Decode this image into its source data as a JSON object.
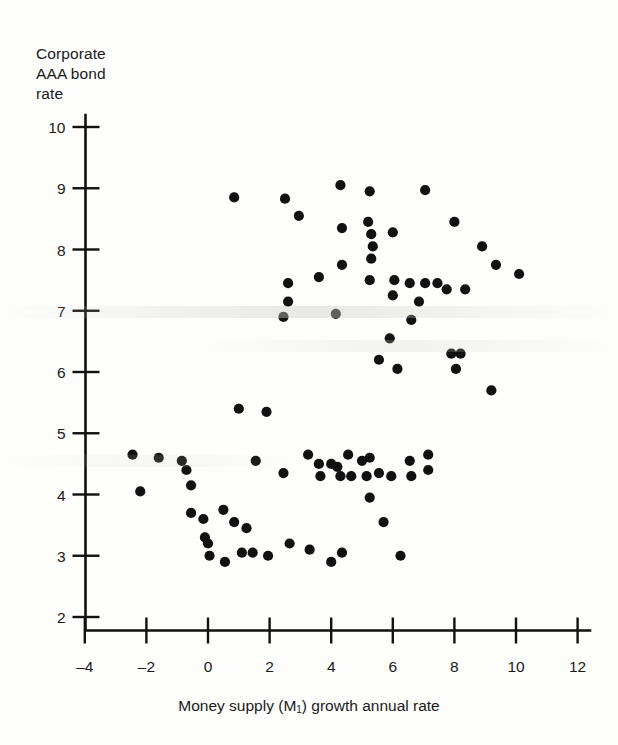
{
  "chart_data": {
    "type": "scatter",
    "title": "",
    "xlabel": "Money supply (M₁) growth annual rate",
    "ylabel": "Corporate AAA bond rate",
    "ylabel_lines": [
      "Corporate",
      "AAA bond",
      "rate"
    ],
    "xlim": [
      -4,
      12
    ],
    "ylim": [
      2,
      10
    ],
    "xticks": [
      -4,
      -2,
      0,
      2,
      4,
      6,
      8,
      10,
      12
    ],
    "xticklabels": [
      "-4",
      "-2",
      "0",
      "2",
      "4",
      "6",
      "8",
      "10",
      "12"
    ],
    "yticks": [
      2,
      3,
      4,
      5,
      6,
      7,
      8,
      9,
      10
    ],
    "yticklabels": [
      "2",
      "3",
      "4",
      "5",
      "6",
      "7",
      "8",
      "9",
      "10"
    ],
    "grid": false,
    "legend": null,
    "marker": "filled-circle",
    "marker_color": "#111111",
    "marker_size": 9,
    "points": [
      [
        0.85,
        8.85
      ],
      [
        2.5,
        8.83
      ],
      [
        2.95,
        8.55
      ],
      [
        4.3,
        9.05
      ],
      [
        5.25,
        8.95
      ],
      [
        7.05,
        8.97
      ],
      [
        4.35,
        8.35
      ],
      [
        5.2,
        8.45
      ],
      [
        5.3,
        8.25
      ],
      [
        5.35,
        8.05
      ],
      [
        6.0,
        8.28
      ],
      [
        8.0,
        8.45
      ],
      [
        8.9,
        8.05
      ],
      [
        5.3,
        7.85
      ],
      [
        4.35,
        7.75
      ],
      [
        3.6,
        7.55
      ],
      [
        5.25,
        7.5
      ],
      [
        6.05,
        7.5
      ],
      [
        6.55,
        7.45
      ],
      [
        7.05,
        7.45
      ],
      [
        7.45,
        7.45
      ],
      [
        7.75,
        7.35
      ],
      [
        8.35,
        7.35
      ],
      [
        10.1,
        7.6
      ],
      [
        9.35,
        7.75
      ],
      [
        2.6,
        7.45
      ],
      [
        2.6,
        7.15
      ],
      [
        2.45,
        6.9
      ],
      [
        4.15,
        6.95
      ],
      [
        6.0,
        7.25
      ],
      [
        6.85,
        7.15
      ],
      [
        6.6,
        6.85
      ],
      [
        5.9,
        6.55
      ],
      [
        5.55,
        6.2
      ],
      [
        6.15,
        6.05
      ],
      [
        7.9,
        6.3
      ],
      [
        8.2,
        6.3
      ],
      [
        8.05,
        6.05
      ],
      [
        9.2,
        5.7
      ],
      [
        1.0,
        5.4
      ],
      [
        1.9,
        5.35
      ],
      [
        -2.45,
        4.65
      ],
      [
        -1.6,
        4.6
      ],
      [
        -0.85,
        4.55
      ],
      [
        -0.7,
        4.4
      ],
      [
        1.55,
        4.55
      ],
      [
        2.45,
        4.35
      ],
      [
        3.25,
        4.65
      ],
      [
        3.6,
        4.5
      ],
      [
        3.65,
        4.3
      ],
      [
        4.0,
        4.5
      ],
      [
        4.2,
        4.45
      ],
      [
        4.3,
        4.3
      ],
      [
        4.55,
        4.65
      ],
      [
        4.65,
        4.3
      ],
      [
        5.0,
        4.55
      ],
      [
        5.15,
        4.3
      ],
      [
        5.25,
        4.6
      ],
      [
        5.55,
        4.35
      ],
      [
        5.95,
        4.3
      ],
      [
        6.55,
        4.55
      ],
      [
        6.6,
        4.3
      ],
      [
        7.15,
        4.65
      ],
      [
        7.15,
        4.4
      ],
      [
        -2.2,
        4.05
      ],
      [
        -0.55,
        4.15
      ],
      [
        -0.55,
        3.7
      ],
      [
        -0.15,
        3.6
      ],
      [
        0.5,
        3.75
      ],
      [
        -0.1,
        3.3
      ],
      [
        0.0,
        3.2
      ],
      [
        0.05,
        3.0
      ],
      [
        0.85,
        3.55
      ],
      [
        1.25,
        3.45
      ],
      [
        0.55,
        2.9
      ],
      [
        1.1,
        3.05
      ],
      [
        1.45,
        3.05
      ],
      [
        1.95,
        3.0
      ],
      [
        2.65,
        3.2
      ],
      [
        3.3,
        3.1
      ],
      [
        4.0,
        2.9
      ],
      [
        4.35,
        3.05
      ],
      [
        5.25,
        3.95
      ],
      [
        5.7,
        3.55
      ],
      [
        6.25,
        3.0
      ]
    ]
  },
  "figure": {
    "background_color": "#fdfdfb",
    "axis_color": "#111111"
  }
}
